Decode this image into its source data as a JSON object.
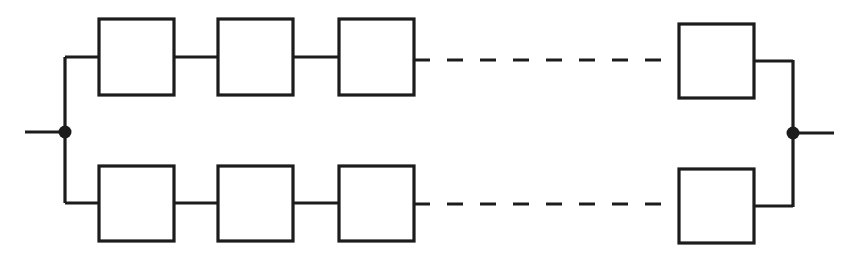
{
  "diagram": {
    "type": "reliability-block-diagram",
    "canvas": {
      "width": 854,
      "height": 264,
      "background": "#ffffff"
    },
    "style": {
      "line_color": "#1c1c1c",
      "line_width": 3.2,
      "block_fill": "#ffffff",
      "node_color": "#1c1c1c",
      "node_radius": 6.5,
      "dash_pattern": "16 17"
    },
    "nodes": [
      {
        "id": "left-node",
        "label": "input junction",
        "x": 65,
        "y": 132,
        "shape": "filled-circle"
      },
      {
        "id": "right-node",
        "label": "output junction",
        "x": 793,
        "y": 133,
        "shape": "filled-circle"
      }
    ],
    "terminals": [
      {
        "id": "input-terminal",
        "label": "input lead",
        "x1": 25,
        "y1": 132,
        "x2": 65,
        "y2": 132
      },
      {
        "id": "output-terminal",
        "label": "output lead",
        "x1": 793,
        "y1": 133,
        "x2": 834,
        "y2": 133
      }
    ],
    "buses": [
      {
        "id": "left-bus",
        "label": "left vertical bus",
        "x": 65,
        "y1": 57,
        "y2": 203
      },
      {
        "id": "right-bus",
        "label": "right vertical bus",
        "x": 793,
        "y1": 60,
        "y2": 207
      }
    ],
    "branches": [
      {
        "id": "top-branch",
        "label": "top parallel path",
        "y": 57,
        "blocks": [
          {
            "id": "top-block-1",
            "label": "",
            "x": 99,
            "y": 19,
            "w": 75,
            "h": 76
          },
          {
            "id": "top-block-2",
            "label": "",
            "x": 218,
            "y": 19,
            "w": 75,
            "h": 76
          },
          {
            "id": "top-block-3",
            "label": "",
            "x": 339,
            "y": 19,
            "w": 75,
            "h": 76
          },
          {
            "id": "top-block-n",
            "label": "",
            "x": 679,
            "y": 24,
            "w": 75,
            "h": 74
          }
        ],
        "connectors": [
          {
            "id": "top-wire-bus-to-1",
            "x1": 65,
            "x2": 99,
            "y": 57
          },
          {
            "id": "top-wire-1-to-2",
            "x1": 174,
            "x2": 218,
            "y": 57
          },
          {
            "id": "top-wire-2-to-3",
            "x1": 293,
            "x2": 339,
            "y": 57
          },
          {
            "id": "top-wire-n-to-bus",
            "x1": 754,
            "x2": 793,
            "y": 61
          }
        ],
        "ellipsis": {
          "id": "top-dashed-gap",
          "label": "continuation dashes",
          "x1": 414,
          "x2": 679,
          "y": 60,
          "dashes": 8
        }
      },
      {
        "id": "bottom-branch",
        "label": "bottom parallel path",
        "y": 203,
        "blocks": [
          {
            "id": "bottom-block-1",
            "label": "",
            "x": 99,
            "y": 166,
            "w": 75,
            "h": 75
          },
          {
            "id": "bottom-block-2",
            "label": "",
            "x": 218,
            "y": 166,
            "w": 75,
            "h": 75
          },
          {
            "id": "bottom-block-3",
            "label": "",
            "x": 339,
            "y": 166,
            "w": 75,
            "h": 75
          },
          {
            "id": "bottom-block-n",
            "label": "",
            "x": 679,
            "y": 169,
            "w": 75,
            "h": 74
          }
        ],
        "connectors": [
          {
            "id": "bottom-wire-bus-to-1",
            "x1": 65,
            "x2": 99,
            "y": 203
          },
          {
            "id": "bottom-wire-1-to-2",
            "x1": 174,
            "x2": 218,
            "y": 203
          },
          {
            "id": "bottom-wire-2-to-3",
            "x1": 293,
            "x2": 339,
            "y": 203
          },
          {
            "id": "bottom-wire-n-to-bus",
            "x1": 754,
            "x2": 793,
            "y": 206
          }
        ],
        "ellipsis": {
          "id": "bottom-dashed-gap",
          "label": "continuation dashes",
          "x1": 414,
          "x2": 679,
          "y": 204,
          "dashes": 8
        }
      }
    ]
  }
}
